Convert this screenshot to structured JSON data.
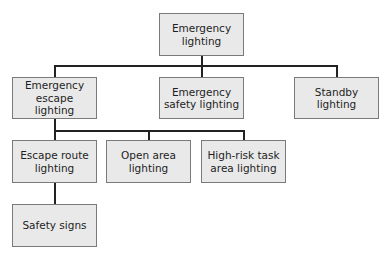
{
  "diagram": {
    "type": "hierarchy-tree",
    "root": {
      "id": "emergency-lighting",
      "label": "Emergency lighting",
      "lines": [
        "Emergency",
        "lighting"
      ]
    },
    "level1": [
      {
        "id": "emergency-escape-lighting",
        "label": "Emergency escape lighting",
        "lines": [
          "Emergency",
          "escape lighting"
        ]
      },
      {
        "id": "emergency-safety-lighting",
        "label": "Emergency safety lighting",
        "lines": [
          "Emergency",
          "safety lighting"
        ]
      },
      {
        "id": "standby-lighting",
        "label": "Standby lighting",
        "lines": [
          "Standby",
          "lighting"
        ]
      }
    ],
    "level2": [
      {
        "id": "escape-route-lighting",
        "parent": "emergency-escape-lighting",
        "label": "Escape route lighting",
        "lines": [
          "Escape route",
          "lighting"
        ]
      },
      {
        "id": "open-area-lighting",
        "parent": "emergency-escape-lighting",
        "label": "Open area lighting",
        "lines": [
          "Open area",
          "lighting"
        ]
      },
      {
        "id": "high-risk-task-area-lighting",
        "parent": "emergency-escape-lighting",
        "label": "High-risk task area lighting",
        "lines": [
          "High-risk task",
          "area lighting"
        ]
      }
    ],
    "level3": [
      {
        "id": "safety-signs",
        "parent": "escape-route-lighting",
        "label": "Safety signs",
        "lines": [
          "Safety signs"
        ]
      }
    ],
    "colors": {
      "node_fill": "#e9e9e9",
      "node_border": "#7a7a7a",
      "connector": "#222222",
      "text": "#1e1e1e",
      "background": "#ffffff"
    }
  }
}
